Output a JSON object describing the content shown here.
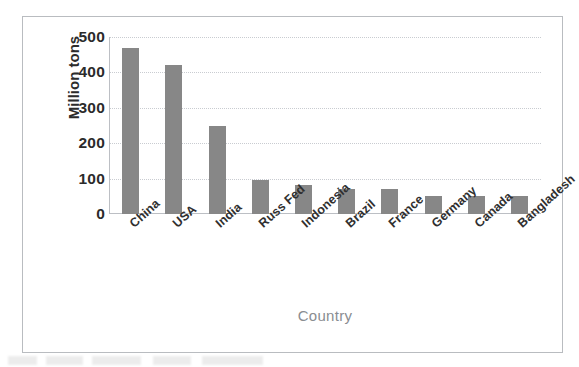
{
  "chart_data": {
    "type": "bar",
    "title": "",
    "subtitle": "",
    "xlabel": "Country",
    "ylabel": "Million tons",
    "categories": [
      "China",
      "USA",
      "India",
      "Russ Fed",
      "Indonesia",
      "Brazil",
      "France",
      "Germany",
      "Canada",
      "Bangladesh"
    ],
    "values": [
      468,
      421,
      248,
      96,
      83,
      72,
      70,
      50,
      50,
      50
    ],
    "series": [
      {
        "name": "Million tons",
        "values": [
          468,
          421,
          248,
          96,
          83,
          72,
          70,
          50,
          50,
          50
        ]
      }
    ],
    "ylim": [
      0,
      500
    ],
    "yticks": [
      0,
      100,
      200,
      300,
      400,
      500
    ],
    "ytick_labels": [
      "0",
      "100",
      "200",
      "300",
      "400",
      "500"
    ],
    "grid": "horizontal-dotted",
    "legend": "none",
    "bar_color": "#878787",
    "gridline_color": "#c9ccd1",
    "axis_color": "#bcbfc4",
    "frame_color": "#b9bcc0",
    "tick_label_color": "#2b2b2b",
    "xlabel_color": "#8a8d91",
    "xtick_rotation_degrees": -42,
    "background": "#ffffff"
  }
}
